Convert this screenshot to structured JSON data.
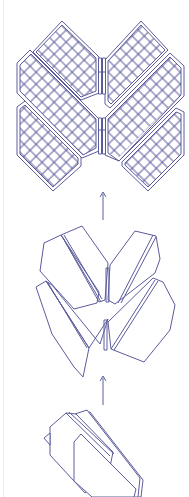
{
  "diagram": {
    "title": "",
    "stroke_color": "#5c5c9c",
    "edge_line_color": "#ececef",
    "stages": [
      {
        "id": "deployed",
        "label": ""
      },
      {
        "id": "partially-unfolded",
        "label": ""
      },
      {
        "id": "stowed",
        "label": ""
      }
    ],
    "arrows": [
      {
        "id": "arrow-stowed-to-partial",
        "direction": "up",
        "label": ""
      },
      {
        "id": "arrow-partial-to-deployed",
        "direction": "up",
        "label": ""
      }
    ]
  }
}
